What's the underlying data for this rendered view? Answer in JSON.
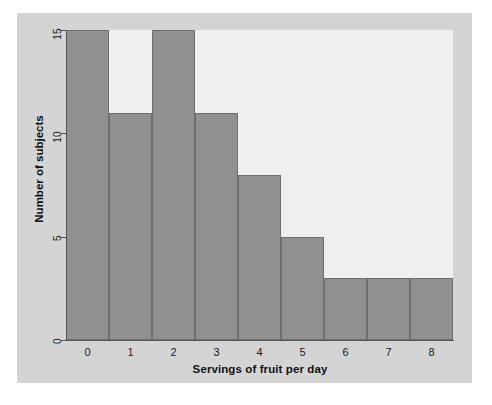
{
  "chart_data": {
    "type": "bar",
    "title": "",
    "subtitle": "",
    "xlabel": "Servings of fruit per day",
    "ylabel": "Number of subjects",
    "categories": [
      "0",
      "1",
      "2",
      "3",
      "4",
      "5",
      "6",
      "7",
      "8"
    ],
    "values": [
      15,
      11,
      15,
      11,
      8,
      5,
      3,
      3,
      3
    ],
    "series": [
      {
        "name": "Number of subjects",
        "values": [
          15,
          11,
          15,
          11,
          8,
          5,
          3,
          3,
          3
        ]
      }
    ],
    "ylim": [
      0,
      15
    ],
    "xlim": [
      -0.5,
      8.5
    ],
    "yticks": [
      0,
      5,
      10,
      15
    ],
    "ytick_labels": [
      "0",
      "5",
      "10",
      "15"
    ],
    "xtick_labels": [
      "0",
      "1",
      "2",
      "3",
      "4",
      "5",
      "6",
      "7",
      "8"
    ],
    "grid": false,
    "legend": false,
    "legend_position": "none",
    "bar_gap": 0,
    "annotations": []
  },
  "style": {
    "bar_fill": "#919191",
    "bar_edge": "#6e6e6e",
    "plot_background": "#efefef",
    "figure_background": "#d4d4d4",
    "page_background": "#ffffff",
    "axis_color": "#555555",
    "text_color": "#111111"
  }
}
